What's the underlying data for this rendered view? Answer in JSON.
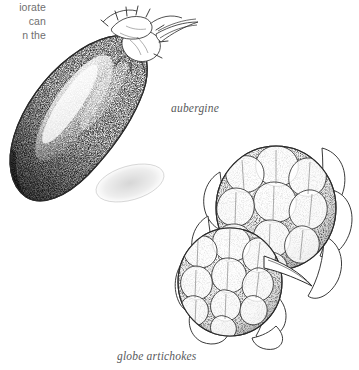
{
  "page": {
    "background_color": "#ffffff",
    "width": 359,
    "height": 370
  },
  "body_text": {
    "color": "#6f6f6f",
    "lines": [
      "iorate",
      "can",
      "n the"
    ]
  },
  "figures": [
    {
      "id": "aubergine",
      "caption": "aubergine",
      "subject": "aubergine",
      "style": "pen-and-ink stipple drawing",
      "ink_color": "#2b2b2b"
    },
    {
      "id": "globe-artichokes",
      "caption": "globe artichokes",
      "subject": "two globe artichoke heads",
      "style": "pen-and-ink stipple drawing",
      "ink_color": "#2b2b2b"
    }
  ],
  "captions": {
    "aubergine": "aubergine",
    "artichokes": "globe artichokes",
    "color": "#58595b"
  },
  "icons": {
    "aubergine": "aubergine-illustration",
    "artichokes": "globe-artichokes-illustration"
  }
}
